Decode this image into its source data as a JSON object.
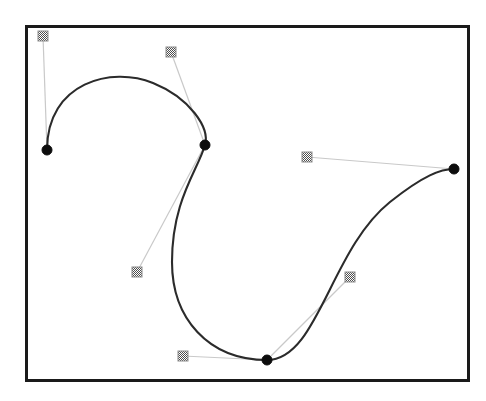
{
  "app": {
    "title": "Bezier Curve Editor",
    "caption": "Bezier spline with anchor points and control handles"
  },
  "canvas": {
    "name": "bezier-canvas",
    "frame": {
      "x": 25,
      "y": 25,
      "width": 445,
      "height": 357
    },
    "background_color": "#ffffff",
    "border_color": "#1a1a1a",
    "border_width": 3
  },
  "style": {
    "curve_color": "#2b2b2b",
    "curve_width": 2.1,
    "handle_line_color": "#c9c9c9",
    "anchor_fill": "#0d0d0d",
    "anchor_radius": 5,
    "control_fill": "#808080",
    "control_stroke": "#8e8e8e",
    "control_size": 10
  },
  "chart_data": {
    "type": "scatter",
    "xlabel": "",
    "ylabel": "",
    "xlim": [
      25,
      470
    ],
    "ylim": [
      25,
      382
    ],
    "grid": false,
    "legend": null,
    "path_d": "M 47 150 C 47 82 112 66 153 83 C 190 98 210 128 205 145 C 198 170 172 200 172 262 C 172 318 208 360 267 360 C 318 360 330 250 390 202 C 424 175 441 169 454 169",
    "segments": [
      {
        "name": "segment-1",
        "start": [
          47,
          150
        ],
        "control1": [
          47,
          82
        ],
        "control2": [
          112,
          66
        ],
        "end": [
          153,
          83
        ]
      },
      {
        "name": "segment-2",
        "start": [
          153,
          83
        ],
        "control1": [
          190,
          98
        ],
        "control2": [
          210,
          128
        ],
        "end": [
          205,
          145
        ]
      },
      {
        "name": "segment-3",
        "start": [
          205,
          145
        ],
        "control1": [
          198,
          170
        ],
        "control2": [
          172,
          200
        ],
        "end": [
          172,
          262
        ]
      },
      {
        "name": "segment-4",
        "start": [
          172,
          262
        ],
        "control1": [
          172,
          318
        ],
        "control2": [
          208,
          360
        ],
        "end": [
          267,
          360
        ]
      },
      {
        "name": "segment-5",
        "start": [
          267,
          360
        ],
        "control1": [
          318,
          360
        ],
        "control2": [
          330,
          250
        ],
        "end": [
          390,
          202
        ]
      },
      {
        "name": "segment-6",
        "start": [
          390,
          202
        ],
        "control1": [
          424,
          175
        ],
        "control2": [
          441,
          169
        ],
        "end": [
          454,
          169
        ]
      }
    ],
    "anchors": [
      {
        "id": "anchor-1",
        "label": "Anchor 1",
        "x": 47,
        "y": 150
      },
      {
        "id": "anchor-2",
        "label": "Anchor 2",
        "x": 205,
        "y": 145
      },
      {
        "id": "anchor-3",
        "label": "Anchor 3",
        "x": 267,
        "y": 360
      },
      {
        "id": "anchor-4",
        "label": "Anchor 4",
        "x": 454,
        "y": 169
      }
    ],
    "controls": [
      {
        "id": "control-1",
        "label": "Control 1",
        "x": 43,
        "y": 36,
        "anchor": "anchor-1"
      },
      {
        "id": "control-2",
        "label": "Control 2",
        "x": 171,
        "y": 52,
        "anchor": "anchor-2"
      },
      {
        "id": "control-3",
        "label": "Control 3",
        "x": 137,
        "y": 272,
        "anchor": "anchor-2"
      },
      {
        "id": "control-4",
        "label": "Control 4",
        "x": 183,
        "y": 356,
        "anchor": "anchor-3"
      },
      {
        "id": "control-5",
        "label": "Control 5",
        "x": 350,
        "y": 277,
        "anchor": "anchor-3"
      },
      {
        "id": "control-6",
        "label": "Control 6",
        "x": 307,
        "y": 157,
        "anchor": "anchor-4"
      }
    ],
    "handle_lines": [
      {
        "id": "handle-line-1",
        "from": [
          47,
          150
        ],
        "to": [
          43,
          36
        ]
      },
      {
        "id": "handle-line-2",
        "from": [
          205,
          145
        ],
        "to": [
          171,
          52
        ]
      },
      {
        "id": "handle-line-3",
        "from": [
          205,
          145
        ],
        "to": [
          137,
          272
        ]
      },
      {
        "id": "handle-line-4",
        "from": [
          267,
          360
        ],
        "to": [
          183,
          356
        ]
      },
      {
        "id": "handle-line-5",
        "from": [
          267,
          360
        ],
        "to": [
          350,
          277
        ]
      },
      {
        "id": "handle-line-6",
        "from": [
          454,
          169
        ],
        "to": [
          307,
          157
        ]
      }
    ]
  }
}
